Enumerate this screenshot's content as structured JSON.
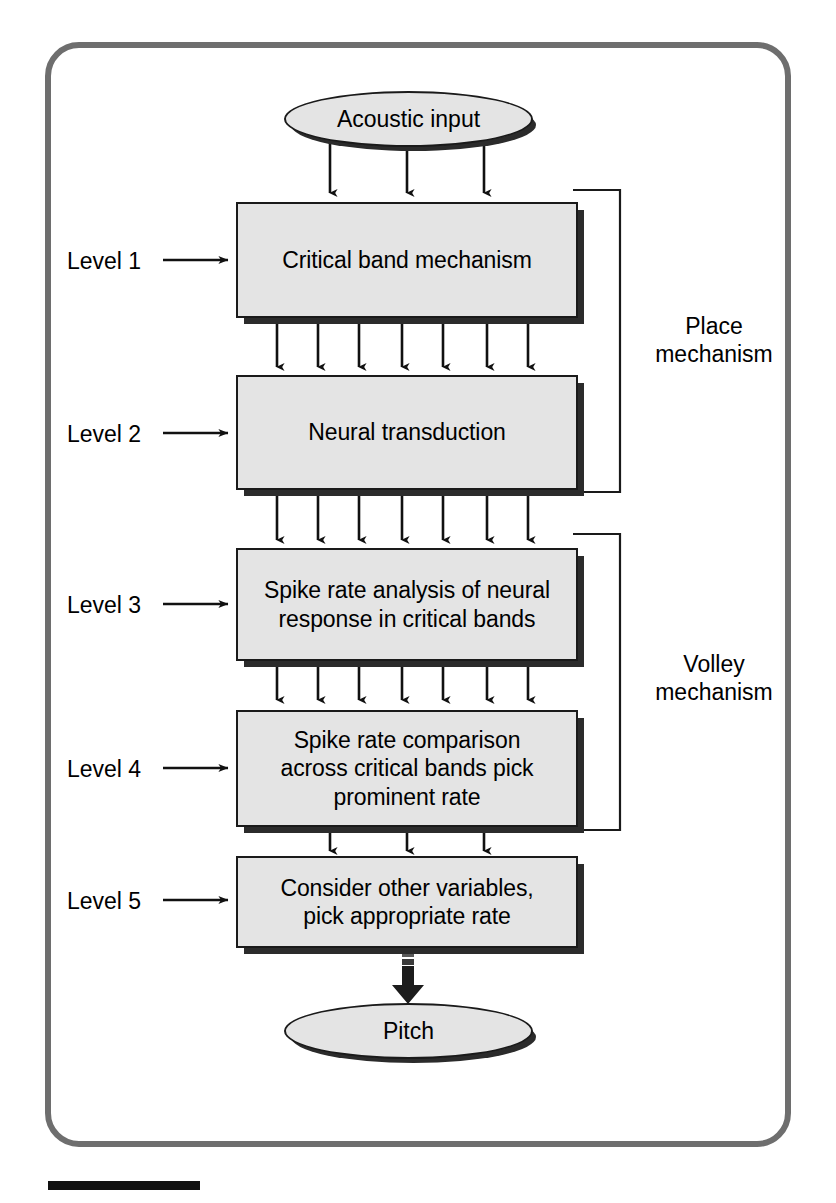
{
  "figure": {
    "frame_color": "#6e6e6e",
    "box_fill": "#e4e4e4",
    "box_stroke": "#1a1a1a",
    "shadow_color": "#2b2b2b"
  },
  "nodes": {
    "input": {
      "label": "Acoustic input",
      "shape": "ellipse"
    },
    "output": {
      "label": "Pitch",
      "shape": "ellipse"
    },
    "boxes": [
      {
        "id": "level1",
        "label": "Critical band mechanism"
      },
      {
        "id": "level2",
        "label": "Neural transduction"
      },
      {
        "id": "level3",
        "label": "Spike rate analysis of neural\nresponse in critical bands"
      },
      {
        "id": "level4",
        "label": "Spike rate comparison\nacross critical bands pick\nprominent rate"
      },
      {
        "id": "level5",
        "label": "Consider other variables,\npick appropriate rate"
      }
    ]
  },
  "level_labels": [
    {
      "id": "level-1",
      "text": "Level 1"
    },
    {
      "id": "level-2",
      "text": "Level 2"
    },
    {
      "id": "level-3",
      "text": "Level 3"
    },
    {
      "id": "level-4",
      "text": "Level 4"
    },
    {
      "id": "level-5",
      "text": "Level 5"
    }
  ],
  "mechanism_brackets": [
    {
      "id": "place",
      "text": "Place\nmechanism",
      "spans": [
        "level1",
        "level2"
      ]
    },
    {
      "id": "volley",
      "text": "Volley\nmechanism",
      "spans": [
        "level3",
        "level4"
      ]
    }
  ],
  "connectors": {
    "input_to_level1": {
      "count": 3,
      "style": "thin-arrow"
    },
    "level1_to_level2": {
      "count": 7,
      "style": "thin-arrow"
    },
    "level2_to_level3": {
      "count": 7,
      "style": "thin-arrow"
    },
    "level3_to_level4": {
      "count": 7,
      "style": "thin-arrow"
    },
    "level4_to_level5": {
      "count": 3,
      "style": "thin-arrow"
    },
    "level5_to_output": {
      "count": 1,
      "style": "block-arrow"
    }
  },
  "scale_bar": {
    "present": true,
    "color": "#111111"
  }
}
